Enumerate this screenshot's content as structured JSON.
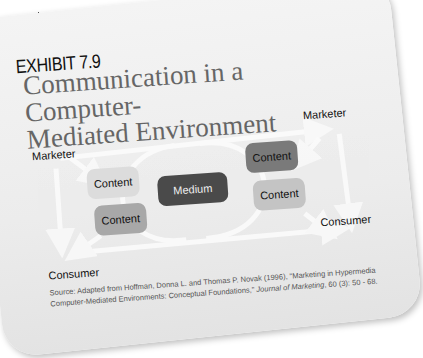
{
  "exhibit": {
    "label": "EXHIBIT 7.9",
    "title_line1": "Communication in a Computer-",
    "title_line2": "Mediated Environment"
  },
  "diagram": {
    "nodes": {
      "marketer_left": "Marketer",
      "consumer_left": "Consumer",
      "marketer_right": "Marketer",
      "consumer_right": "Consumer",
      "content_left_top": "Content",
      "content_left_bottom": "Content",
      "medium": "Medium",
      "content_right_top": "Content",
      "content_right_bottom": "Content"
    },
    "colors": {
      "medium_box": "#4a4a4a",
      "content_light": "#d8d8d8",
      "content_mid": "#a9a9a9",
      "content_dark": "#7a7a7a",
      "arrow": "#f7f7f7"
    }
  },
  "source": {
    "prefix": "Source: Adapted from Hoffman, Donna L. and Thomas P. Novak (1996), \"Marketing in Hypermedia Computer-Mediated Environments: Conceptual Foundations,\" ",
    "journal": "Journal of Marketing",
    "suffix": ", 60 (3): 50 - 68."
  }
}
